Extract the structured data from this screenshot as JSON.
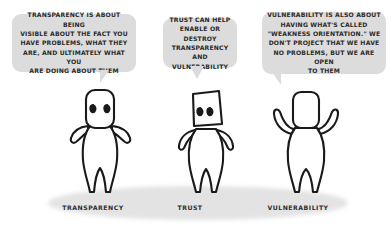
{
  "illustration": {
    "title": "Transparency, Trust and Vulnerability",
    "colors": {
      "background": "#ffffff",
      "bubble_fill": "#dcdcdc",
      "ink": "#1a1a1a",
      "text": "#2b2b2b",
      "ground_shadow": "#e3e3e3"
    }
  },
  "bubbles": [
    {
      "id": "transparency",
      "text": "TRANSPARENCY IS ABOUT BEING\nVISIBLE ABOUT THE FACT YOU\nHAVE PROBLEMS, WHAT THEY\nARE, AND ULTIMATELY WHAT YOU\nARE DOING ABOUT THEM"
    },
    {
      "id": "trust",
      "text": "TRUST CAN HELP\nENABLE OR DESTROY\nTRANSPARENCY AND\nVULNERABILITY"
    },
    {
      "id": "vulnerability",
      "text": "VULNERABILITY IS ALSO ABOUT\nHAVING WHAT'S CALLED\n\"WEAKNESS ORIENTATION.\" WE\nDON'T PROJECT THAT WE HAVE\nNO PROBLEMS, BUT WE ARE OPEN\nTO THEM"
    }
  ],
  "figures": [
    {
      "id": "transparency",
      "caption": "TRANSPARENCY",
      "pose": "facing-forward-eyes-visible"
    },
    {
      "id": "trust",
      "caption": "TRUST",
      "pose": "facing-forward-hands-near-face"
    },
    {
      "id": "vulnerability",
      "caption": "VULNERABILITY",
      "pose": "facing-away-arms-raised"
    }
  ]
}
